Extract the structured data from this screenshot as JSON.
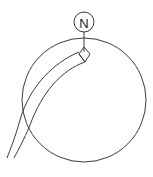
{
  "diagram": {
    "type": "technical-schematic",
    "north_marker": {
      "label": "N",
      "cx": 84,
      "cy": 22,
      "r": 10
    },
    "stem": {
      "x": 84,
      "y1": 32,
      "y2": 52
    },
    "main_circle": {
      "cx": 84,
      "cy": 100,
      "r": 62
    },
    "junction": {
      "shape": "diamond",
      "points": "84,47 90,54 85,62 79,54"
    },
    "tube": {
      "outer_path": "M79,52 C55,62 30,85 20,120 C15,138 10,150 7,158",
      "inner_path": "M85,62 C62,70 42,92 30,125 C24,140 18,150 14,158"
    },
    "colors": {
      "line": "#3a3a3a",
      "background": "#ffffff",
      "text": "#222222"
    }
  }
}
